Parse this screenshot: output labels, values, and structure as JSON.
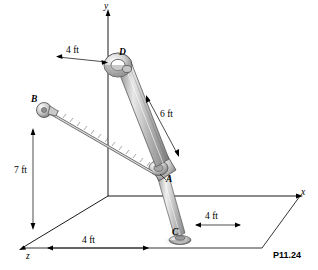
{
  "figure": {
    "tag": "P11.24",
    "axes": {
      "y": "y",
      "x": "x",
      "z": "z"
    },
    "points": {
      "a": "A",
      "b": "B",
      "c": "C",
      "d": "D"
    },
    "dimensions": {
      "top_left": "4 ft",
      "bar_length": "6 ft",
      "vertical": "7 ft",
      "bottom_right": "4 ft",
      "bottom_left": "4 ft"
    },
    "colors": {
      "line": "#000000",
      "body_fill": "#c9c9c9",
      "body_shade": "#8d8d8d",
      "highlight": "#f2f2f2",
      "ground": "#ffffff"
    }
  }
}
